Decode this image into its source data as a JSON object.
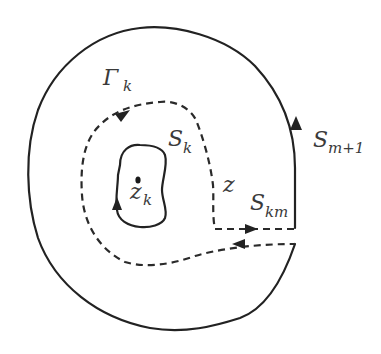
{
  "diagram": {
    "type": "contour-integration-diagram",
    "colors": {
      "stroke": "#222222",
      "label": "#3a3a3a",
      "background": "#ffffff"
    },
    "labels": {
      "gamma_k": {
        "main": "Γ",
        "sub": "k"
      },
      "s_k": {
        "main": "S",
        "sub": "k"
      },
      "z_k": {
        "main": "z",
        "sub": "k"
      },
      "z": {
        "main": "z"
      },
      "s_km": {
        "main": "S",
        "sub": "km"
      },
      "s_m1": {
        "main": "S",
        "sub": "m+1"
      }
    },
    "curves": [
      {
        "name": "outer-contour-S-m+1",
        "style": "solid",
        "direction": "counter-clockwise (arrow up on right side)"
      },
      {
        "name": "dashed-contour-Gamma-k",
        "style": "dashed",
        "direction": "clockwise (arrow on upper-left)"
      },
      {
        "name": "inner-contour-S-k",
        "style": "solid",
        "direction": "arrow on left side"
      },
      {
        "name": "cut-S-km",
        "style": "dashed",
        "direction": "pair of parallel lines with opposite arrows"
      }
    ],
    "points": [
      {
        "name": "singular-point-z_k",
        "marker": "dot"
      }
    ]
  }
}
